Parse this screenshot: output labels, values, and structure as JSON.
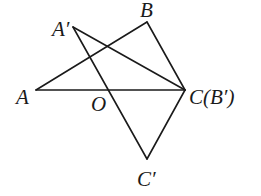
{
  "diagram": {
    "type": "geometry",
    "points": {
      "A": {
        "label": "A",
        "x": 36,
        "y": 90
      },
      "B": {
        "label": "B",
        "x": 147,
        "y": 22
      },
      "C": {
        "label": "C(B′)",
        "x": 185,
        "y": 90
      },
      "A'": {
        "label": "A′",
        "x": 73,
        "y": 27
      },
      "C'": {
        "label": "C′",
        "x": 147,
        "y": 159
      },
      "O": {
        "label": "O",
        "x": 108,
        "y": 90
      }
    },
    "labels": {
      "A": "A",
      "B": "B",
      "C": "C(B′)",
      "A_prime": "A′",
      "C_prime": "C′",
      "O": "O"
    },
    "segments": [
      [
        "A",
        "B"
      ],
      [
        "B",
        "C"
      ],
      [
        "A",
        "C"
      ],
      [
        "A'",
        "C"
      ],
      [
        "A'",
        "C'"
      ],
      [
        "C",
        "C'"
      ]
    ],
    "stroke_color": "#1a1a1a"
  }
}
